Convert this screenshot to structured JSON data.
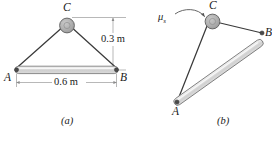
{
  "figure": {
    "caption_a": "(a)",
    "caption_b": "(b)",
    "colors": {
      "line": "#333333",
      "bar_fill": "#d9d9d9",
      "bar_highlight": "#f0f0f0",
      "bar_stroke": "#666666",
      "peg_fill": "#b0b0b0",
      "peg_stroke": "#555555",
      "dim_line": "#8a8a8a",
      "text": "#1a1a1a"
    },
    "panel_a": {
      "name": "bar-suspended-level",
      "points": {
        "A": "A",
        "B": "B",
        "C": "C"
      },
      "dimensions": [
        {
          "id": "height",
          "label": "0.3 m",
          "orientation": "vertical"
        },
        {
          "id": "span",
          "label": "0.6 m",
          "orientation": "horizontal"
        }
      ]
    },
    "panel_b": {
      "name": "bar-suspended-tilted",
      "points": {
        "A": "A",
        "B": "B",
        "C": "C"
      },
      "annotations": [
        {
          "id": "friction-coefficient",
          "symbol": "μ",
          "subscript": "s"
        }
      ]
    }
  }
}
